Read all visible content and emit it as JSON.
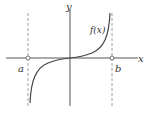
{
  "diagram": {
    "labels": {
      "x_axis": "x",
      "y_axis": "y",
      "function": "f(x)",
      "left_bound": "a",
      "right_bound": "b"
    },
    "colors": {
      "axis": "#555555",
      "curve": "#444444",
      "asymptote": "#888888",
      "text": "#333333"
    }
  }
}
